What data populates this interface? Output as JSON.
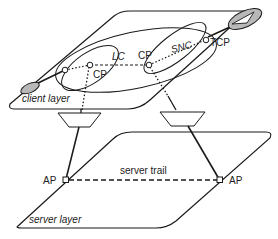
{
  "diagram": {
    "type": "layered-network-architecture",
    "colors": {
      "stroke": "#1a1a1a",
      "fill_grey": "#b8b8b8",
      "background": "#ffffff"
    },
    "client_layer": {
      "label": "client layer",
      "points": [
        {
          "id": "cp_left",
          "label": "CP"
        },
        {
          "id": "cp_right",
          "label": "CP"
        },
        {
          "id": "tcp",
          "label": "TCP"
        }
      ],
      "connections": [
        {
          "id": "lc",
          "label": "LC",
          "from": "cp_left",
          "to": "cp_right",
          "style": "dashed"
        },
        {
          "id": "snc",
          "label": "SNC",
          "from": "cp_right",
          "to": "tcp",
          "style": "dotted"
        }
      ]
    },
    "adaptation": [
      {
        "id": "adapt_left",
        "shape": "trapezoid"
      },
      {
        "id": "adapt_right",
        "shape": "trapezoid"
      }
    ],
    "server_layer": {
      "label": "server layer",
      "points": [
        {
          "id": "ap_left",
          "label": "AP"
        },
        {
          "id": "ap_right",
          "label": "AP"
        }
      ],
      "connections": [
        {
          "id": "server_trail",
          "label": "server trail",
          "from": "ap_left",
          "to": "ap_right",
          "style": "dashed"
        }
      ]
    }
  }
}
